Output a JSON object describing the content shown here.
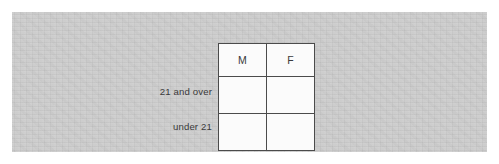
{
  "page": {
    "background_color": "#ffffff",
    "panel_color": "#cacaca"
  },
  "table": {
    "border_color": "#2e2e2e",
    "cell_color": "#fbfbfb",
    "text_color": "#39393a",
    "column_headers": [
      "M",
      "F"
    ],
    "corner_header": "",
    "row_labels": [
      "21 and over",
      "under 21"
    ],
    "rows": [
      {
        "label": "21 and over",
        "cells": [
          "",
          ""
        ]
      },
      {
        "label": "under 21",
        "cells": [
          "",
          ""
        ]
      }
    ]
  }
}
